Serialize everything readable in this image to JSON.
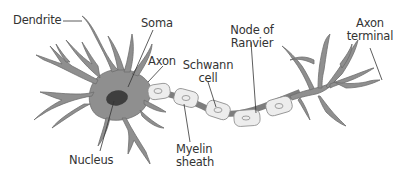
{
  "colors": {
    "cell_fill": "#8f8f8f",
    "cell_stroke": "#6e6e6e",
    "nucleus": "#3e3e3e",
    "myelin_fill": "#ededed",
    "myelin_stroke": "#8a8a8a",
    "node": "#7d7d7d",
    "leader_line": "#333333",
    "text": "#333333"
  },
  "labels": {
    "dendrite": "Dendrite",
    "soma": "Soma",
    "axon": "Axon",
    "schwann_cell_line1": "Schwann",
    "schwann_cell_line2": "cell",
    "node_of_ranvier_line1": "Node of",
    "node_of_ranvier_line2": "Ranvier",
    "axon_terminal_line1": "Axon",
    "axon_terminal_line2": "terminal",
    "nucleus": "Nucleus",
    "myelin_sheath_line1": "Myelin",
    "myelin_sheath_line2": "sheath"
  }
}
